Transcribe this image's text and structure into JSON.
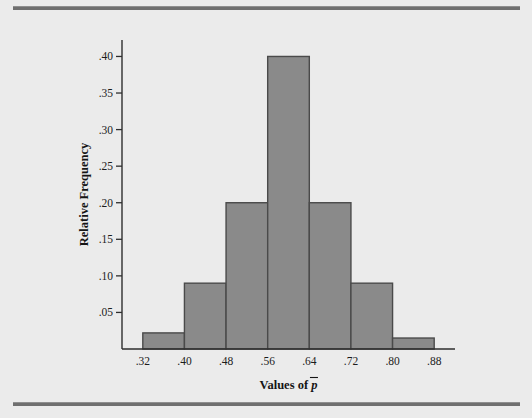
{
  "figure": {
    "background_color": "#ebebeb",
    "rule_color": "#6f6f6f",
    "name": "histogram-figure"
  },
  "chart_data": {
    "type": "bar",
    "title": "",
    "subtitle": "",
    "xlabel": "Values of p̄",
    "xlabel_prefix": "Values of ",
    "xlabel_symbol": "p",
    "ylabel": "Relative Frequency",
    "categories": [
      ".32-.40",
      ".40-.48",
      ".48-.56",
      ".56-.64",
      ".64-.72",
      ".72-.80",
      ".80-.88"
    ],
    "bin_edges": [
      0.32,
      0.4,
      0.48,
      0.56,
      0.64,
      0.72,
      0.8,
      0.88
    ],
    "values": [
      0.022,
      0.09,
      0.2,
      0.4,
      0.2,
      0.09,
      0.015
    ],
    "xtick_labels": [
      ".32",
      ".40",
      ".48",
      ".56",
      ".64",
      ".72",
      ".80",
      ".88"
    ],
    "xtick_values": [
      0.32,
      0.4,
      0.48,
      0.56,
      0.64,
      0.72,
      0.8,
      0.88
    ],
    "ytick_labels": [
      ".05",
      ".10",
      ".15",
      ".20",
      ".25",
      ".30",
      ".35",
      ".40"
    ],
    "ytick_values": [
      0.05,
      0.1,
      0.15,
      0.2,
      0.25,
      0.3,
      0.35,
      0.4
    ],
    "xlim": [
      0.28,
      0.92
    ],
    "ylim": [
      0.0,
      0.4225
    ],
    "grid": false,
    "legend": false,
    "bar_fill_color": "#8a8a8a",
    "bar_edge_color": "#4a4a4a",
    "axis_color": "#2e2e2e"
  }
}
